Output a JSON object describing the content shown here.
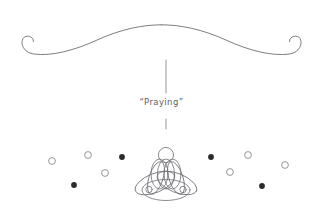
{
  "illustration": {
    "title_caption": "“Praying”",
    "caption_plain": "Praying",
    "background_color": "#ffffff",
    "stroke_color": "#6e6e75",
    "dot_fill_color": "#2b2b2f",
    "dot_hollow_color": "#8a8a92",
    "text_color": "#5d5d63",
    "elements": {
      "ornament_divider": "flourish-divider-with-curled-ends",
      "upper_connector": "vertical-line",
      "lower_connector": "short-vertical-tick",
      "figure": "meditating-lotus-figure"
    }
  },
  "ornament": {
    "name": "flourish-divider",
    "left_curl_x": 22,
    "right_curl_x": 301,
    "baseline_y": 53,
    "apex_y": 26
  },
  "connectors": {
    "upper": {
      "x": 166,
      "y1": 60,
      "y2": 93
    },
    "lower": {
      "x": 166,
      "y1": 119,
      "y2": 129
    }
  },
  "figure": {
    "center_x": 166,
    "head": {
      "cx": 166,
      "cy": 155,
      "r": 7.5
    },
    "body_label": "torso-and-crossed-legs",
    "hands_left": {
      "cx": 149,
      "cy": 189,
      "r": 3.2
    },
    "hands_right": {
      "cx": 183,
      "cy": 189,
      "r": 3.2
    }
  },
  "dots": [
    {
      "id": "dot-l1",
      "cx": 52,
      "cy": 161,
      "r": 3.4,
      "filled": false
    },
    {
      "id": "dot-l2",
      "cx": 88,
      "cy": 155,
      "r": 3.4,
      "filled": false
    },
    {
      "id": "dot-l3",
      "cx": 105,
      "cy": 173,
      "r": 3.4,
      "filled": false
    },
    {
      "id": "dot-l4",
      "cx": 122,
      "cy": 157,
      "r": 2.9,
      "filled": true
    },
    {
      "id": "dot-l5",
      "cx": 74,
      "cy": 185,
      "r": 2.9,
      "filled": true
    },
    {
      "id": "dot-r1",
      "cx": 285,
      "cy": 165,
      "r": 3.4,
      "filled": false
    },
    {
      "id": "dot-r2",
      "cx": 248,
      "cy": 155,
      "r": 3.4,
      "filled": false
    },
    {
      "id": "dot-r3",
      "cx": 230,
      "cy": 172,
      "r": 3.4,
      "filled": false
    },
    {
      "id": "dot-r4",
      "cx": 211,
      "cy": 157,
      "r": 2.9,
      "filled": true
    },
    {
      "id": "dot-r5",
      "cx": 262,
      "cy": 186,
      "r": 2.9,
      "filled": true
    }
  ]
}
